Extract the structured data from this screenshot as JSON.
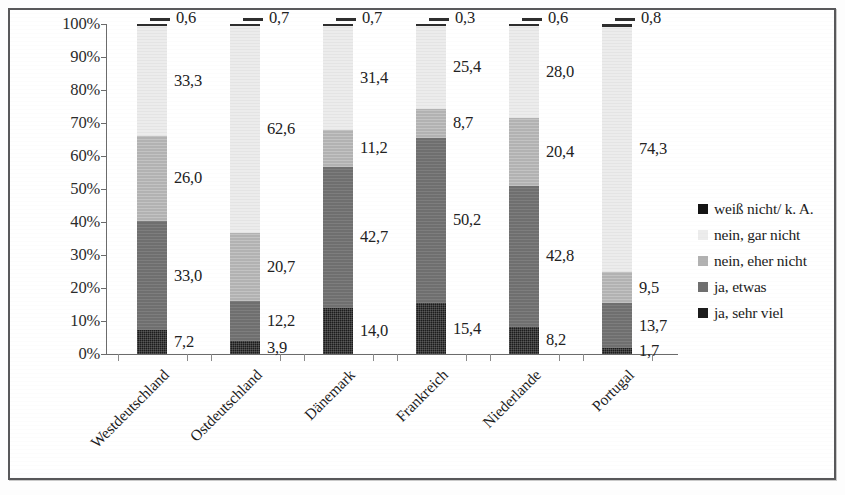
{
  "chart_data": {
    "type": "bar",
    "variant": "100% stacked column",
    "title": "",
    "xlabel": "",
    "ylabel": "",
    "ylim": [
      0,
      100
    ],
    "grid": false,
    "legend_position": "right",
    "categories": [
      "Westdeutschland",
      "Ostdeutschland",
      "Dänemark",
      "Frankreich",
      "Niederlande",
      "Portugal"
    ],
    "y_ticks": [
      "0%",
      "10%",
      "20%",
      "30%",
      "40%",
      "50%",
      "60%",
      "70%",
      "80%",
      "90%",
      "100%"
    ],
    "series": [
      {
        "name": "ja, sehr viel",
        "color": "#1c1c1c",
        "values": [
          7.2,
          3.9,
          14.0,
          15.4,
          8.2,
          1.7
        ],
        "labels": [
          "7,2",
          "3,9",
          "14,0",
          "15,4",
          "8,2",
          "1,7"
        ]
      },
      {
        "name": "ja, etwas",
        "color": "#6f6f6f",
        "values": [
          33.0,
          12.2,
          42.7,
          50.2,
          42.8,
          13.7
        ],
        "labels": [
          "33,0",
          "12,2",
          "42,7",
          "50,2",
          "42,8",
          "13,7"
        ]
      },
      {
        "name": "nein, eher nicht",
        "color": "#b2b2b2",
        "values": [
          26.0,
          20.7,
          11.2,
          8.7,
          20.4,
          9.5
        ],
        "labels": [
          "26,0",
          "20,7",
          "11,2",
          "8,7",
          "20,4",
          "9,5"
        ]
      },
      {
        "name": "nein, gar nicht",
        "color": "#ececec",
        "values": [
          33.3,
          62.6,
          31.4,
          25.4,
          28.0,
          74.3
        ],
        "labels": [
          "33,3",
          "62,6",
          "31,4",
          "25,4",
          "28,0",
          "74,3"
        ]
      },
      {
        "name": "weiß nicht/ k. A.",
        "color": "#2e2e2e",
        "values": [
          0.6,
          0.7,
          0.7,
          0.3,
          0.6,
          0.8
        ],
        "labels": [
          "0,6",
          "0,7",
          "0,7",
          "0,3",
          "0,6",
          "0,8"
        ]
      }
    ]
  },
  "legend": {
    "items": [
      {
        "label": "weiß nicht/ k. A.",
        "swatch": "s4"
      },
      {
        "label": "nein, gar nicht",
        "swatch": "s3"
      },
      {
        "label": "nein, eher nicht",
        "swatch": "s2"
      },
      {
        "label": "ja, etwas",
        "swatch": "s1"
      },
      {
        "label": "ja, sehr viel",
        "swatch": "s0"
      }
    ]
  }
}
